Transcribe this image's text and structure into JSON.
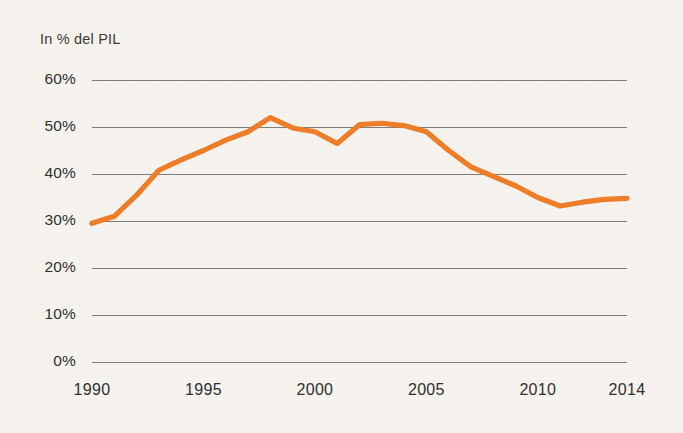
{
  "chart_data": {
    "type": "line",
    "title": "",
    "subtitle": "",
    "xlabel": "",
    "ylabel": "In % del PIL",
    "axis_note": "In % del PIL",
    "xlim": [
      1990,
      2014
    ],
    "ylim": [
      0,
      60
    ],
    "grid": true,
    "legend": "none",
    "y_ticks": [
      "0%",
      "10%",
      "20%",
      "30%",
      "40%",
      "50%",
      "60%"
    ],
    "y_tick_values": [
      0,
      10,
      20,
      30,
      40,
      50,
      60
    ],
    "x_ticks": [
      "1990",
      "1995",
      "2000",
      "2005",
      "2010",
      "2014"
    ],
    "x_tick_values": [
      1990,
      1995,
      2000,
      2005,
      2010,
      2014
    ],
    "series": [
      {
        "name": "In % del PIL",
        "color": "#f07d28",
        "x": [
          1990,
          1991,
          1992,
          1993,
          1994,
          1995,
          1996,
          1997,
          1998,
          1999,
          2000,
          2001,
          2002,
          2003,
          2004,
          2005,
          2006,
          2007,
          2008,
          2009,
          2010,
          2011,
          2012,
          2013,
          2014
        ],
        "values": [
          29.5,
          31.0,
          35.5,
          40.8,
          43.0,
          45.0,
          47.2,
          49.0,
          52.0,
          49.8,
          49.0,
          46.5,
          50.5,
          50.8,
          50.3,
          49.0,
          45.0,
          41.5,
          39.5,
          37.5,
          35.0,
          33.2,
          34.0,
          34.6,
          34.8
        ]
      }
    ]
  },
  "colors": {
    "background": "#f7f4ef",
    "line": "#f07d28",
    "gridline": "#6e6a63",
    "text": "#2f2f2f"
  }
}
